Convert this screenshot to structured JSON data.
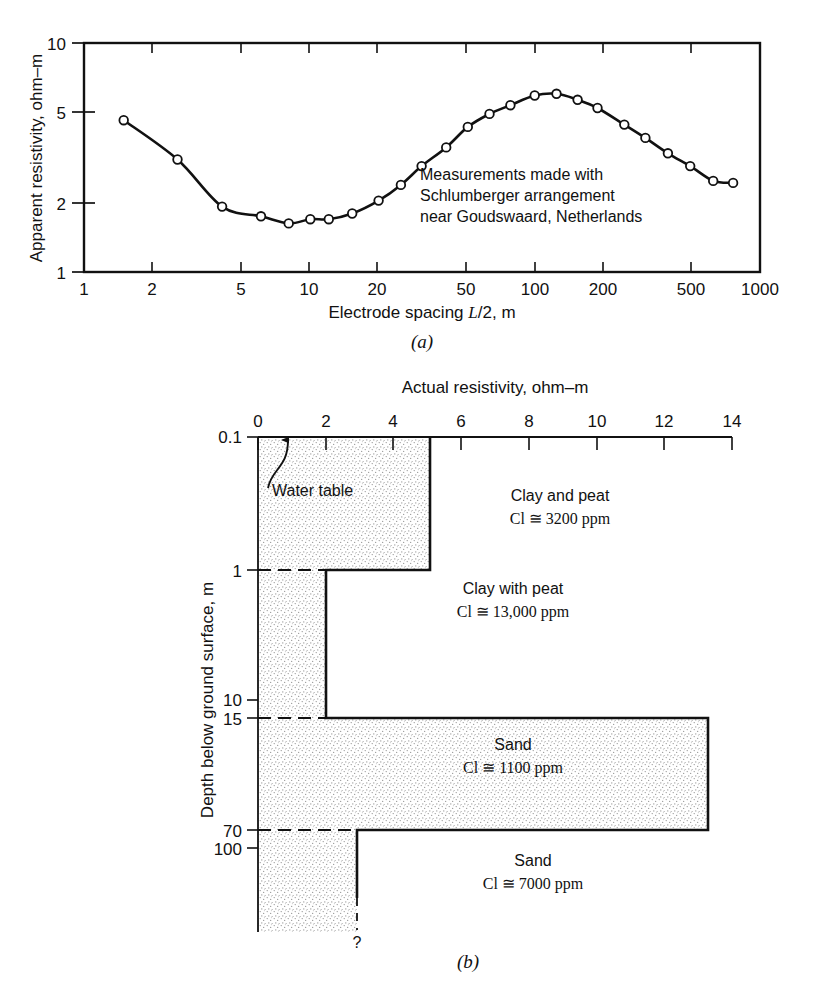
{
  "figure": {
    "panel_a_caption": "(a)",
    "panel_b_caption": "(b)"
  },
  "chart_data": [
    {
      "id": "panel-a",
      "type": "line",
      "title": "",
      "xlabel": "Electrode spacing L/2, m",
      "xlabel_parts": {
        "pre": "Electrode spacing ",
        "italic": "L",
        "post": "/2, m"
      },
      "ylabel": "Apparent resistivity, ohm–m",
      "xscale": "log",
      "yscale": "log",
      "xlim": [
        1,
        1000
      ],
      "ylim": [
        1,
        10
      ],
      "xticks": [
        1,
        2,
        5,
        10,
        20,
        50,
        100,
        200,
        500,
        1000
      ],
      "xticklabels": [
        "1",
        "2",
        "5",
        "10",
        "20",
        "50",
        "100",
        "200",
        "500",
        "1000"
      ],
      "yticks": [
        1,
        2,
        5,
        10
      ],
      "yticklabels": [
        "1",
        "2",
        "5",
        "10"
      ],
      "grid": false,
      "marker": "open-circle",
      "annotation_lines": [
        "Measurements made with",
        "Schlumberger arrangement",
        "near Goudswaard, Netherlands"
      ],
      "series": [
        {
          "name": "Apparent resistivity",
          "x": [
            1.5,
            2.6,
            4.1,
            6.1,
            8.1,
            10.1,
            12.2,
            15.5,
            20.3,
            25.5,
            31.5,
            40.5,
            50.5,
            63,
            78,
            100,
            125,
            155,
            190,
            250,
            310,
            390,
            490,
            620,
            760
          ],
          "y": [
            4.6,
            3.1,
            1.93,
            1.75,
            1.63,
            1.7,
            1.7,
            1.8,
            2.05,
            2.4,
            2.9,
            3.5,
            4.3,
            4.9,
            5.35,
            5.9,
            6.0,
            5.65,
            5.2,
            4.4,
            3.85,
            3.3,
            2.9,
            2.5,
            2.45
          ]
        }
      ]
    },
    {
      "id": "panel-b",
      "type": "step",
      "title": "Actual resistivity, ohm–m",
      "xlabel": "Actual resistivity, ohm–m",
      "ylabel": "Depth below ground surface, m",
      "xlim": [
        0,
        14
      ],
      "xticks": [
        0,
        2,
        4,
        6,
        8,
        10,
        12,
        14
      ],
      "xticklabels": [
        "0",
        "2",
        "4",
        "6",
        "8",
        "10",
        "12",
        "14"
      ],
      "yscale": "log-depth",
      "yticks": [
        0.1,
        1,
        10,
        15,
        70,
        100
      ],
      "yticklabels": [
        "0.1",
        "1",
        "10",
        "15",
        "70",
        "100"
      ],
      "grid": false,
      "layers": [
        {
          "name": "Clay and peat",
          "cl_label": "Cl ≅ 3200 ppm",
          "resistivity": 5.0,
          "depth_top": 0.1,
          "depth_bottom": 1
        },
        {
          "name": "Clay with peat",
          "cl_label": "Cl ≅ 13,000 ppm",
          "resistivity": 2.0,
          "depth_top": 1,
          "depth_bottom": 15
        },
        {
          "name": "Sand",
          "cl_label": "Cl ≅ 1100 ppm",
          "resistivity": 13.2,
          "depth_top": 15,
          "depth_bottom": 70
        },
        {
          "name": "Sand",
          "cl_label": "Cl ≅ 7000 ppm",
          "resistivity": 2.9,
          "depth_top": 70,
          "depth_bottom": null
        }
      ],
      "annotations": [
        {
          "name": "water-table",
          "text": "Water table",
          "x": 0.9,
          "depth": 0.1
        },
        {
          "name": "unknown-depth-marker",
          "text": "?"
        }
      ]
    }
  ]
}
